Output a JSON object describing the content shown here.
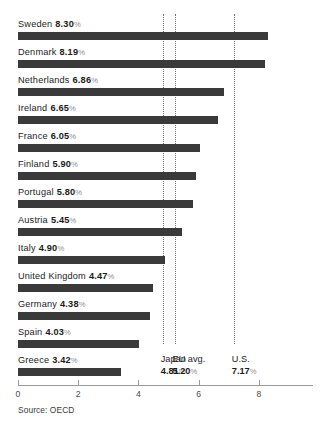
{
  "chart_data": {
    "type": "bar",
    "orientation": "horizontal",
    "title": "",
    "subtitle": "",
    "xlabel": "",
    "ylabel": "",
    "xlim": [
      0,
      9.8
    ],
    "grid": false,
    "legend": "none",
    "unit": "%",
    "categories": [
      "Sweden",
      "Denmark",
      "Netherlands",
      "Ireland",
      "France",
      "Finland",
      "Portugal",
      "Austria",
      "Italy",
      "United Kingdom",
      "Germany",
      "Spain",
      "Greece"
    ],
    "values": [
      8.3,
      8.19,
      6.86,
      6.65,
      6.05,
      5.9,
      5.8,
      5.45,
      4.9,
      4.47,
      4.38,
      4.03,
      3.42
    ],
    "value_labels": [
      "8.30",
      "8.19",
      "6.86",
      "6.65",
      "6.05",
      "5.90",
      "5.80",
      "5.45",
      "4.90",
      "4.47",
      "4.38",
      "4.03",
      "3.42"
    ],
    "xticks": [
      0,
      2,
      4,
      6,
      8
    ],
    "xtick_labels": [
      "0",
      "2",
      "4",
      "6",
      "8"
    ],
    "reference_lines": [
      {
        "name": "Japan",
        "value": 4.81,
        "value_label": "4.81"
      },
      {
        "name": "EU avg.",
        "value": 5.2,
        "value_label": "5.20"
      },
      {
        "name": "U.S.",
        "value": 7.17,
        "value_label": "7.17"
      }
    ],
    "source": "Source: OECD",
    "colors": {
      "bar": "#3a3a3a",
      "reference_line": "#6e6e6e",
      "axis": "#9a9a9a",
      "background": "#ffffff",
      "text": "#1b1b1b",
      "percent_sign": "#8d8d8d"
    }
  },
  "rows": [
    {
      "label": "Sweden",
      "value": "8.30",
      "pct": "%"
    },
    {
      "label": "Denmark",
      "value": "8.19",
      "pct": "%"
    },
    {
      "label": "Netherlands",
      "value": "6.86",
      "pct": "%"
    },
    {
      "label": "Ireland",
      "value": "6.65",
      "pct": "%"
    },
    {
      "label": "France",
      "value": "6.05",
      "pct": "%"
    },
    {
      "label": "Finland",
      "value": "5.90",
      "pct": "%"
    },
    {
      "label": "Portugal",
      "value": "5.80",
      "pct": "%"
    },
    {
      "label": "Austria",
      "value": "5.45",
      "pct": "%"
    },
    {
      "label": "Italy",
      "value": "4.90",
      "pct": "%"
    },
    {
      "label": "United Kingdom",
      "value": "4.47",
      "pct": "%"
    },
    {
      "label": "Germany",
      "value": "4.38",
      "pct": "%"
    },
    {
      "label": "Spain",
      "value": "4.03",
      "pct": "%"
    },
    {
      "label": "Greece",
      "value": "3.42",
      "pct": "%"
    }
  ],
  "markers": [
    {
      "name": "Japan",
      "value": "4.81",
      "pct": "%"
    },
    {
      "name": "EU avg.",
      "value": "5.20",
      "pct": "%"
    },
    {
      "name": "U.S.",
      "value": "7.17",
      "pct": "%"
    }
  ],
  "axis": {
    "ticks": [
      "0",
      "2",
      "4",
      "6",
      "8"
    ]
  },
  "footer": {
    "source": "Source: OECD"
  }
}
